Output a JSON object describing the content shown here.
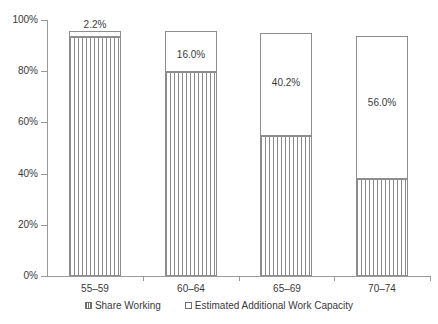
{
  "chart_data": {
    "type": "bar",
    "subtype": "stacked-bar",
    "title": "",
    "subtitle": "",
    "xlabel": "",
    "ylabel": "",
    "ylim": [
      0,
      100
    ],
    "ytick_labels": [
      "0%",
      "20%",
      "40%",
      "60%",
      "80%",
      "100%"
    ],
    "ytick_values": [
      0,
      20,
      40,
      60,
      80,
      100
    ],
    "grid": false,
    "legend_position": "bottom-center",
    "categories": [
      "55–59",
      "60–64",
      "65–69",
      "70–74"
    ],
    "series": [
      {
        "name": "Share Working",
        "pattern": "vertical-hatch",
        "values": [
          93.5,
          79.7,
          54.5,
          38.0
        ],
        "labels_shown": false
      },
      {
        "name": "Estimated Additional Work Capacity",
        "pattern": "solid-white",
        "values": [
          2.2,
          16.0,
          40.2,
          56.0
        ],
        "labels_shown": true,
        "data_labels": [
          "2.2%",
          "16.0%",
          "40.2%",
          "56.0%"
        ]
      }
    ],
    "totals": [
      95.7,
      95.7,
      94.7,
      94.0
    ],
    "colors": {
      "axis": "#9a9a9a",
      "bar_border": "#8d8d8d",
      "hatch": "#8a8a8a",
      "text": "#3a3a3a",
      "background": "#ffffff"
    }
  },
  "legend": {
    "items": [
      {
        "label": "Share Working",
        "swatch": "hatched"
      },
      {
        "label": "Estimated Additional Work Capacity",
        "swatch": "white"
      }
    ]
  }
}
